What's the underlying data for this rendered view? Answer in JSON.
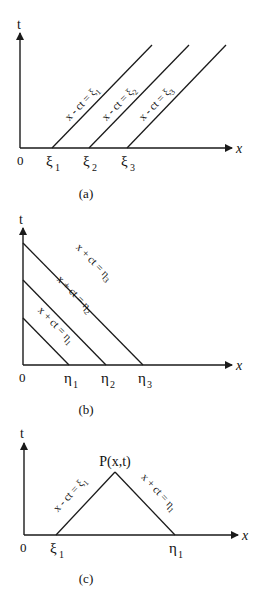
{
  "panels": [
    {
      "id": "a",
      "caption": "(a)",
      "axis_t": "t",
      "axis_x": "x",
      "origin": "0",
      "ticks": [
        {
          "base": "ξ",
          "sub": "1"
        },
        {
          "base": "ξ",
          "sub": "2"
        },
        {
          "base": "ξ",
          "sub": "3"
        }
      ],
      "lines": [
        {
          "label": "x - ct = ξ",
          "sub": "1"
        },
        {
          "label": "x - ct = ξ",
          "sub": "2"
        },
        {
          "label": "x - ct = ξ",
          "sub": "3"
        }
      ]
    },
    {
      "id": "b",
      "caption": "(b)",
      "axis_t": "t",
      "axis_x": "x",
      "origin": "0",
      "ticks": [
        {
          "base": "η",
          "sub": "1"
        },
        {
          "base": "η",
          "sub": "2"
        },
        {
          "base": "η",
          "sub": "3"
        }
      ],
      "lines": [
        {
          "label": "x + ct = η",
          "sub": "1"
        },
        {
          "label": "x + ct = η",
          "sub": "2"
        },
        {
          "label": "x + ct = η",
          "sub": "3"
        }
      ]
    },
    {
      "id": "c",
      "caption": "(c)",
      "axis_t": "t",
      "axis_x": "x",
      "origin": "0",
      "point_label": "P(x,t)",
      "ticks": [
        {
          "base": "ξ",
          "sub": "1"
        },
        {
          "base": "η",
          "sub": "1"
        }
      ],
      "lines": [
        {
          "label": "x - ct = ξ",
          "sub": "1"
        },
        {
          "label": "x + ct = η",
          "sub": "1"
        }
      ]
    }
  ]
}
